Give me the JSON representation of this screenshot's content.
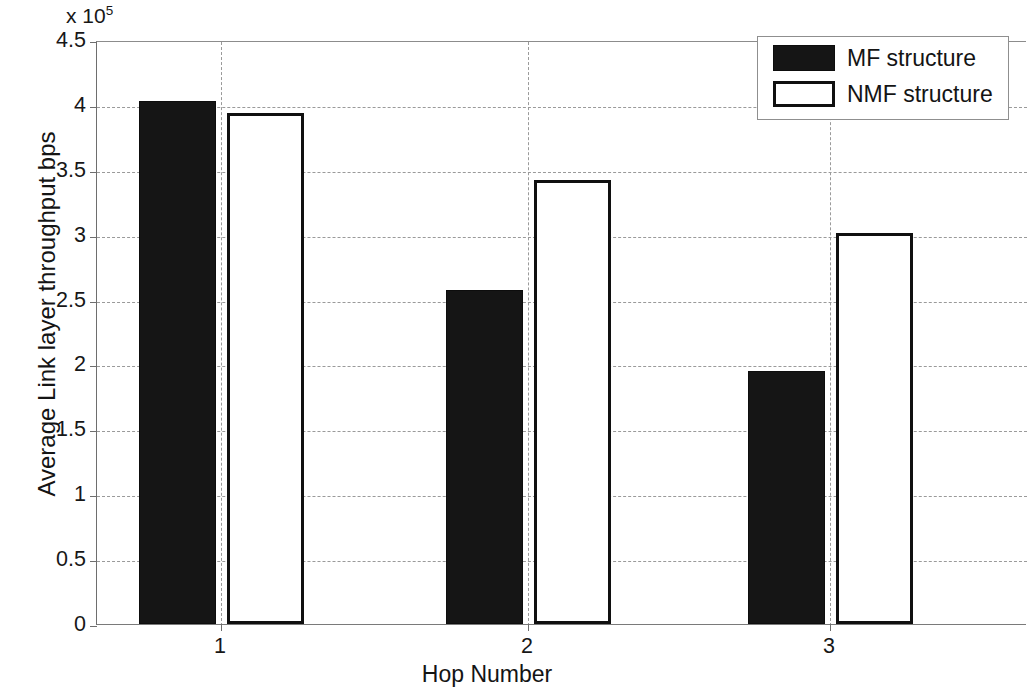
{
  "chart_data": {
    "type": "bar",
    "title": "",
    "xlabel": "Hop Number",
    "ylabel": "Average Link layer throughput bps",
    "exponent_label": "x 10",
    "exponent_power": "5",
    "categories": [
      "1",
      "2",
      "3"
    ],
    "series": [
      {
        "name": "MF structure",
        "values": [
          4.03,
          2.57,
          1.95
        ],
        "style": "filled"
      },
      {
        "name": "NMF structure",
        "values": [
          3.94,
          3.42,
          3.01
        ],
        "style": "hollow"
      }
    ],
    "value_scale": 100000,
    "ylim": [
      0,
      4.5
    ],
    "ytick_labels": [
      "0",
      "0.5",
      "1",
      "1.5",
      "2",
      "2.5",
      "3",
      "3.5",
      "4",
      "4.5"
    ],
    "ytick_values": [
      0,
      0.5,
      1,
      1.5,
      2,
      2.5,
      3,
      3.5,
      4,
      4.5
    ],
    "grid": "dashed-both-axes",
    "legend_position": "top-right",
    "legend_entries": [
      "MF structure",
      "NMF structure"
    ]
  },
  "legend": {
    "entries": [
      {
        "label": "MF structure",
        "swatch": "filled-black-rect"
      },
      {
        "label": "NMF structure",
        "swatch": "hollow-black-outline-rect"
      }
    ]
  },
  "axes": {
    "y_title": "Average Link layer throughput bps",
    "x_title": "Hop Number",
    "exponent": "x 10",
    "exponent_sup": "5"
  },
  "colors": {
    "mf_fill": "#151515",
    "nmf_fill": "#ffffff",
    "nmf_stroke": "#101010",
    "grid": "#9a9a9a",
    "axis": "#6e6e6e",
    "text": "#171717",
    "background": "#ffffff"
  }
}
